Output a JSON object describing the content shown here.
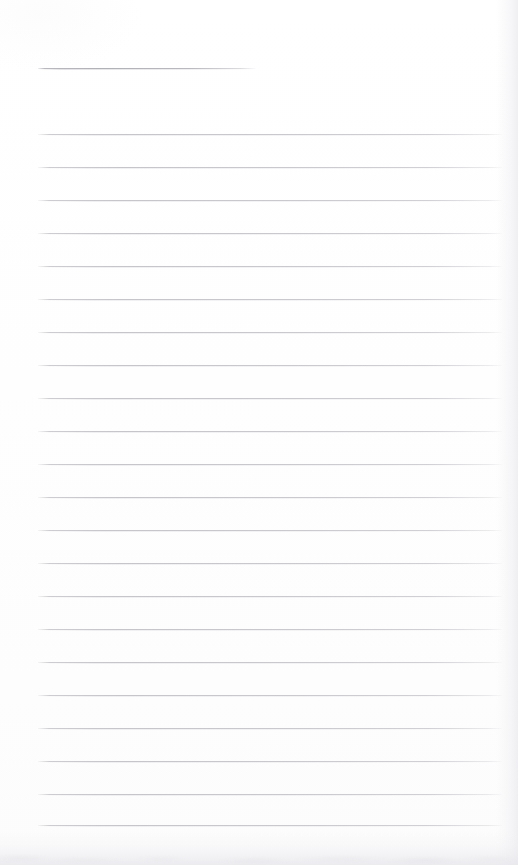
{
  "document": {
    "type": "scanned-lined-notepad-page",
    "title": "",
    "visible_text": "",
    "background_color": "#fefefe",
    "width": 518,
    "height": 865
  },
  "rules": {
    "line_color": "#c9c9cd",
    "header_line_color": "#b4b4ba",
    "left_margin_px": 38,
    "right_margin_px": 502,
    "line_spacing_px": 33,
    "header": {
      "label": "header-rule",
      "y": 68,
      "x_start": 38,
      "x_end": 256
    },
    "body_lines": [
      {
        "label": "rule-1",
        "y": 134
      },
      {
        "label": "rule-2",
        "y": 167
      },
      {
        "label": "rule-3",
        "y": 200
      },
      {
        "label": "rule-4",
        "y": 233
      },
      {
        "label": "rule-5",
        "y": 266
      },
      {
        "label": "rule-6",
        "y": 299
      },
      {
        "label": "rule-7",
        "y": 332
      },
      {
        "label": "rule-8",
        "y": 365
      },
      {
        "label": "rule-9",
        "y": 398
      },
      {
        "label": "rule-10",
        "y": 431
      },
      {
        "label": "rule-11",
        "y": 464
      },
      {
        "label": "rule-12",
        "y": 497
      },
      {
        "label": "rule-13",
        "y": 530
      },
      {
        "label": "rule-14",
        "y": 563
      },
      {
        "label": "rule-15",
        "y": 596
      },
      {
        "label": "rule-16",
        "y": 629
      },
      {
        "label": "rule-17",
        "y": 662
      },
      {
        "label": "rule-18",
        "y": 695
      },
      {
        "label": "rule-19",
        "y": 728
      },
      {
        "label": "rule-20",
        "y": 761
      },
      {
        "label": "rule-21",
        "y": 794
      },
      {
        "label": "rule-22",
        "y": 825
      }
    ]
  },
  "artifacts": {
    "right_edge": {
      "label": "page-edge-shadow",
      "x": 496,
      "width": 22
    },
    "bottom_edge": {
      "label": "scan-shadow-band",
      "y": 831,
      "height": 34
    }
  }
}
